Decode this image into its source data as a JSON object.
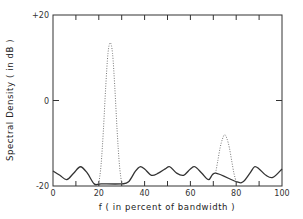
{
  "chart_data": {
    "type": "line",
    "title": "",
    "xlabel": "f ( in percent of bandwidth )",
    "ylabel": "Spectral  Density  ( in dB )",
    "xlim": [
      0,
      100
    ],
    "ylim": [
      -20,
      20
    ],
    "x_ticks": [
      0,
      20,
      40,
      60,
      80,
      100
    ],
    "x_tick_labels": [
      "0",
      "20",
      "40",
      "60",
      "80",
      "100"
    ],
    "x_minor_ticks": [
      10,
      30,
      50,
      70,
      90
    ],
    "y_ticks": [
      -20,
      0,
      20
    ],
    "y_tick_labels": [
      "-20",
      "0",
      "+20"
    ],
    "grid": false,
    "legend": null,
    "series": [
      {
        "name": "solid ripple (out-of-band)",
        "style": "solid",
        "x": [
          0,
          3,
          6,
          9,
          12,
          15,
          18,
          21,
          30,
          33,
          36,
          38,
          40,
          43,
          46,
          49,
          51,
          54,
          57,
          60,
          62,
          65,
          68,
          71,
          80,
          83,
          86,
          88,
          90,
          93,
          96,
          100
        ],
        "y": [
          -16.5,
          -17.5,
          -18.5,
          -17,
          -15.5,
          -17,
          -19.5,
          -19.5,
          -19.5,
          -19,
          -16.5,
          -15.5,
          -16,
          -17.5,
          -17,
          -16,
          -15.5,
          -17,
          -17.5,
          -16,
          -15.5,
          -17,
          -18.5,
          -17,
          -19,
          -19,
          -17,
          -15.5,
          -16,
          -17.5,
          -18,
          -16
        ]
      },
      {
        "name": "dotted peak 1",
        "style": "dotted",
        "x": [
          20,
          21,
          22,
          23,
          24,
          25,
          26,
          27,
          28,
          29,
          30
        ],
        "y": [
          -19.5,
          -15,
          -7,
          3,
          11,
          13.5,
          11,
          3,
          -7,
          -15,
          -19.5
        ]
      },
      {
        "name": "dotted peak 2",
        "style": "dotted",
        "x": [
          71,
          72,
          73,
          74,
          75,
          76,
          77,
          78,
          79,
          80
        ],
        "y": [
          -17,
          -14,
          -11,
          -9,
          -8,
          -9,
          -11,
          -14,
          -17,
          -19
        ]
      }
    ]
  }
}
